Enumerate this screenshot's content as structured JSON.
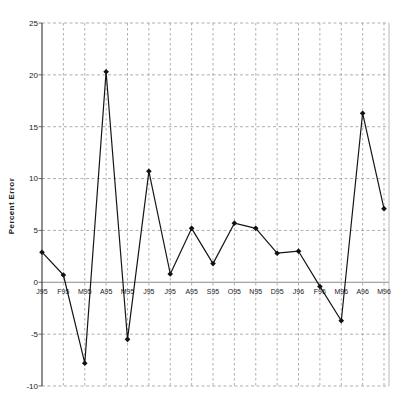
{
  "chart_data": {
    "type": "line",
    "title": "",
    "xlabel": "",
    "ylabel": "Percent Error",
    "categories": [
      "J95",
      "F95",
      "M95",
      "A95",
      "M95",
      "J95",
      "J95",
      "A95",
      "S95",
      "O95",
      "N95",
      "D95",
      "J96",
      "F96",
      "M96",
      "A96",
      "M96"
    ],
    "values": [
      2.9,
      0.7,
      -7.8,
      20.3,
      -5.5,
      10.7,
      0.8,
      5.2,
      1.8,
      5.7,
      5.2,
      2.8,
      3.0,
      -0.4,
      -3.7,
      16.3,
      7.1
    ],
    "ylim": [
      -10,
      25
    ],
    "yticks": [
      25,
      20,
      15,
      10,
      5,
      0,
      -5,
      -10
    ],
    "grid": "dashed-both-axes",
    "legend": "none",
    "marker": "diamond",
    "colors": {
      "line": "#151515",
      "marker": "#111111",
      "grid": "#9a9a9a",
      "zero_line": "#8a8a8a",
      "axis": "#444444",
      "frame_right": "#b8b8b8",
      "tick_text": "#222222",
      "background": "#ffffff"
    }
  }
}
